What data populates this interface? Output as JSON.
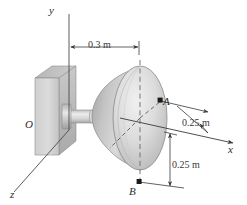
{
  "figure": {
    "axes": {
      "y_label": "y",
      "x_label": "x",
      "z_label": "z",
      "origin_label": "O"
    },
    "points": [
      {
        "id": "A",
        "label": "A"
      },
      {
        "id": "B",
        "label": "B"
      }
    ],
    "dimensions": [
      {
        "id": "axial-offset",
        "label": "0.3 m",
        "orientation": "horizontal"
      },
      {
        "id": "radius-a",
        "label": "0.25 m",
        "orientation": "oblique"
      },
      {
        "id": "radius-b",
        "label": "0.25 m",
        "orientation": "vertical"
      }
    ],
    "colors": {
      "line": "#3a3a3a",
      "text": "#2b2b2b",
      "wall_light": "#d8d8d8",
      "wall_mid": "#bdbdbd",
      "wall_dark": "#a8a8a8",
      "cone_light": "#e6e6e6",
      "cone_mid": "#c9c9c9",
      "cone_dark": "#a9a9a9",
      "shaft": "#d0d0d0",
      "marker": "#1a1a1a"
    }
  }
}
